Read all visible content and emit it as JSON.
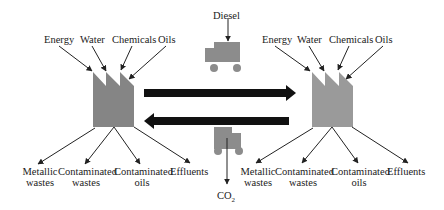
{
  "diagram": {
    "left_plant": {
      "inputs": [
        "Energy",
        "Water",
        "Chemicals",
        "Oils"
      ],
      "outputs": [
        {
          "line1": "Metallic",
          "line2": "wastes"
        },
        {
          "line1": "Contaminated",
          "line2": "wastes"
        },
        {
          "line1": "Contaminated",
          "line2": "oils"
        },
        {
          "line1": "Effluents",
          "line2": ""
        }
      ],
      "color": "#858585"
    },
    "right_plant": {
      "inputs": [
        "Energy",
        "Water",
        "Chemicals",
        "Oils"
      ],
      "outputs": [
        {
          "line1": "Metallic",
          "line2": "wastes"
        },
        {
          "line1": "Contaminated",
          "line2": "wastes"
        },
        {
          "line1": "Contaminated",
          "line2": "oils"
        },
        {
          "line1": "Effluents",
          "line2": ""
        }
      ],
      "color": "#9a9a9a"
    },
    "transport": {
      "input_label": "Diesel",
      "output_label": "CO",
      "output_subscript": "2",
      "truck_color": "#8c8c8c",
      "arrow_color": "#111111"
    }
  }
}
